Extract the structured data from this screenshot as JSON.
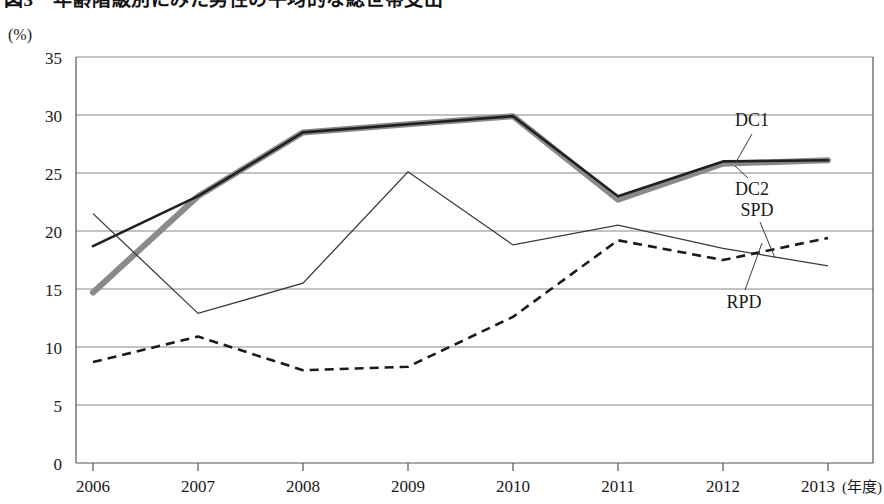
{
  "title": "図3　年齢階級別にみた男性の平均的な総世帯支出",
  "unit_label": "(%)",
  "x_unit_label": "(年度)",
  "axis": {
    "y_ticks": [
      "0",
      "5",
      "10",
      "15",
      "20",
      "25",
      "30",
      "35"
    ],
    "x_ticks": [
      "2006",
      "2007",
      "2008",
      "2009",
      "2010",
      "2011",
      "2012",
      "2013"
    ]
  },
  "series_labels": {
    "dc1": "DC1",
    "dc2": "DC2",
    "spd": "SPD",
    "rpd": "RPD"
  },
  "colors": {
    "dc1": "#231f20",
    "dc2": "#8a8a8a",
    "spd": "#3a3a3a",
    "rpd": "#1a1a1a",
    "grid": "#888888",
    "axis": "#555555",
    "background": "#ffffff"
  },
  "chart_data": {
    "type": "line",
    "title": "図3　年齢階級別にみた男性の平均的な総世帯支出",
    "xlabel": "(年度)",
    "ylabel": "(%)",
    "ylim": [
      0,
      35
    ],
    "ytick_step": 5,
    "grid": true,
    "legend": "inline-annotations-right",
    "categories": [
      "2006",
      "2007",
      "2008",
      "2009",
      "2010",
      "2011",
      "2012",
      "2013"
    ],
    "series": [
      {
        "name": "DC1",
        "style": "solid-thin-black",
        "values": [
          18.7,
          23.0,
          28.5,
          29.2,
          29.9,
          23.0,
          26.0,
          26.1
        ]
      },
      {
        "name": "DC2",
        "style": "solid-thick-gray",
        "values": [
          14.7,
          23.0,
          28.5,
          29.2,
          29.9,
          22.7,
          25.8,
          26.1
        ]
      },
      {
        "name": "SPD",
        "style": "solid-thin",
        "values": [
          21.5,
          12.9,
          15.5,
          25.1,
          18.8,
          20.5,
          18.5,
          17.0
        ]
      },
      {
        "name": "RPD",
        "style": "dashed",
        "values": [
          8.7,
          10.9,
          8.0,
          8.3,
          12.6,
          19.2,
          17.5,
          19.4
        ]
      }
    ]
  }
}
